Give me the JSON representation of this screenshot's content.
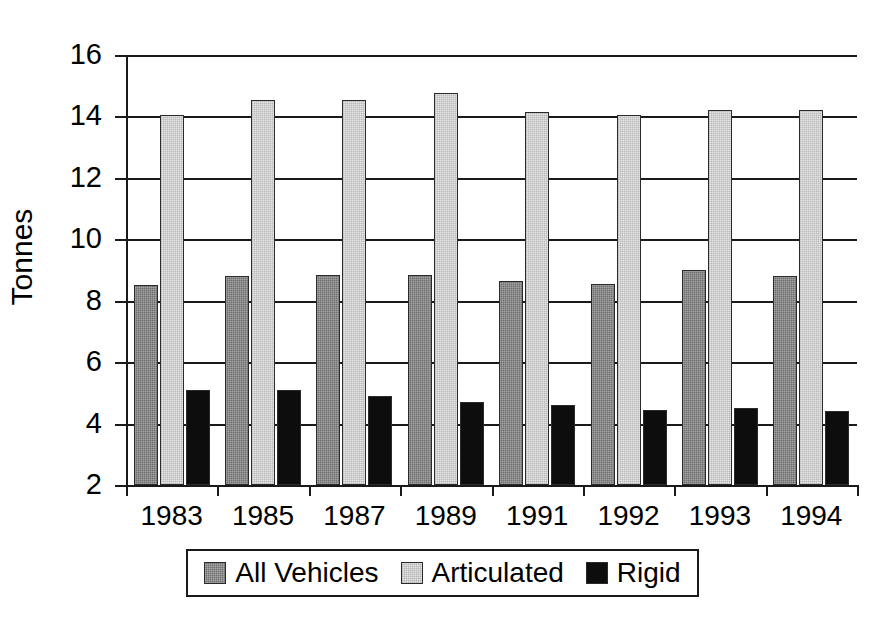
{
  "chart_data": {
    "type": "bar",
    "title": "",
    "xlabel": "",
    "ylabel": "Tonnes",
    "categories": [
      "1983",
      "1985",
      "1987",
      "1989",
      "1991",
      "1992",
      "1993",
      "1994"
    ],
    "series": [
      {
        "name": "All Vehicles",
        "color": "#6e6e6e",
        "values": [
          8.5,
          8.8,
          8.85,
          8.85,
          8.65,
          8.55,
          9.0,
          8.8
        ]
      },
      {
        "name": "Articulated",
        "color": "#e6e6e6",
        "values": [
          14.05,
          14.55,
          14.55,
          14.75,
          14.15,
          14.05,
          14.2,
          14.2
        ]
      },
      {
        "name": "Rigid",
        "color": "#0d0d0d",
        "values": [
          5.1,
          5.1,
          4.9,
          4.7,
          4.6,
          4.45,
          4.5,
          4.4
        ]
      }
    ],
    "ylim": [
      2,
      16
    ],
    "ytick_values": [
      2,
      4,
      6,
      8,
      10,
      12,
      14,
      16
    ],
    "ytick_labels": [
      "2",
      "4",
      "6",
      "8",
      "10",
      "12",
      "14",
      "16"
    ],
    "grid": true,
    "legend_position": "bottom",
    "legend_entries": [
      "All Vehicles",
      "Articulated",
      "Rigid"
    ]
  }
}
